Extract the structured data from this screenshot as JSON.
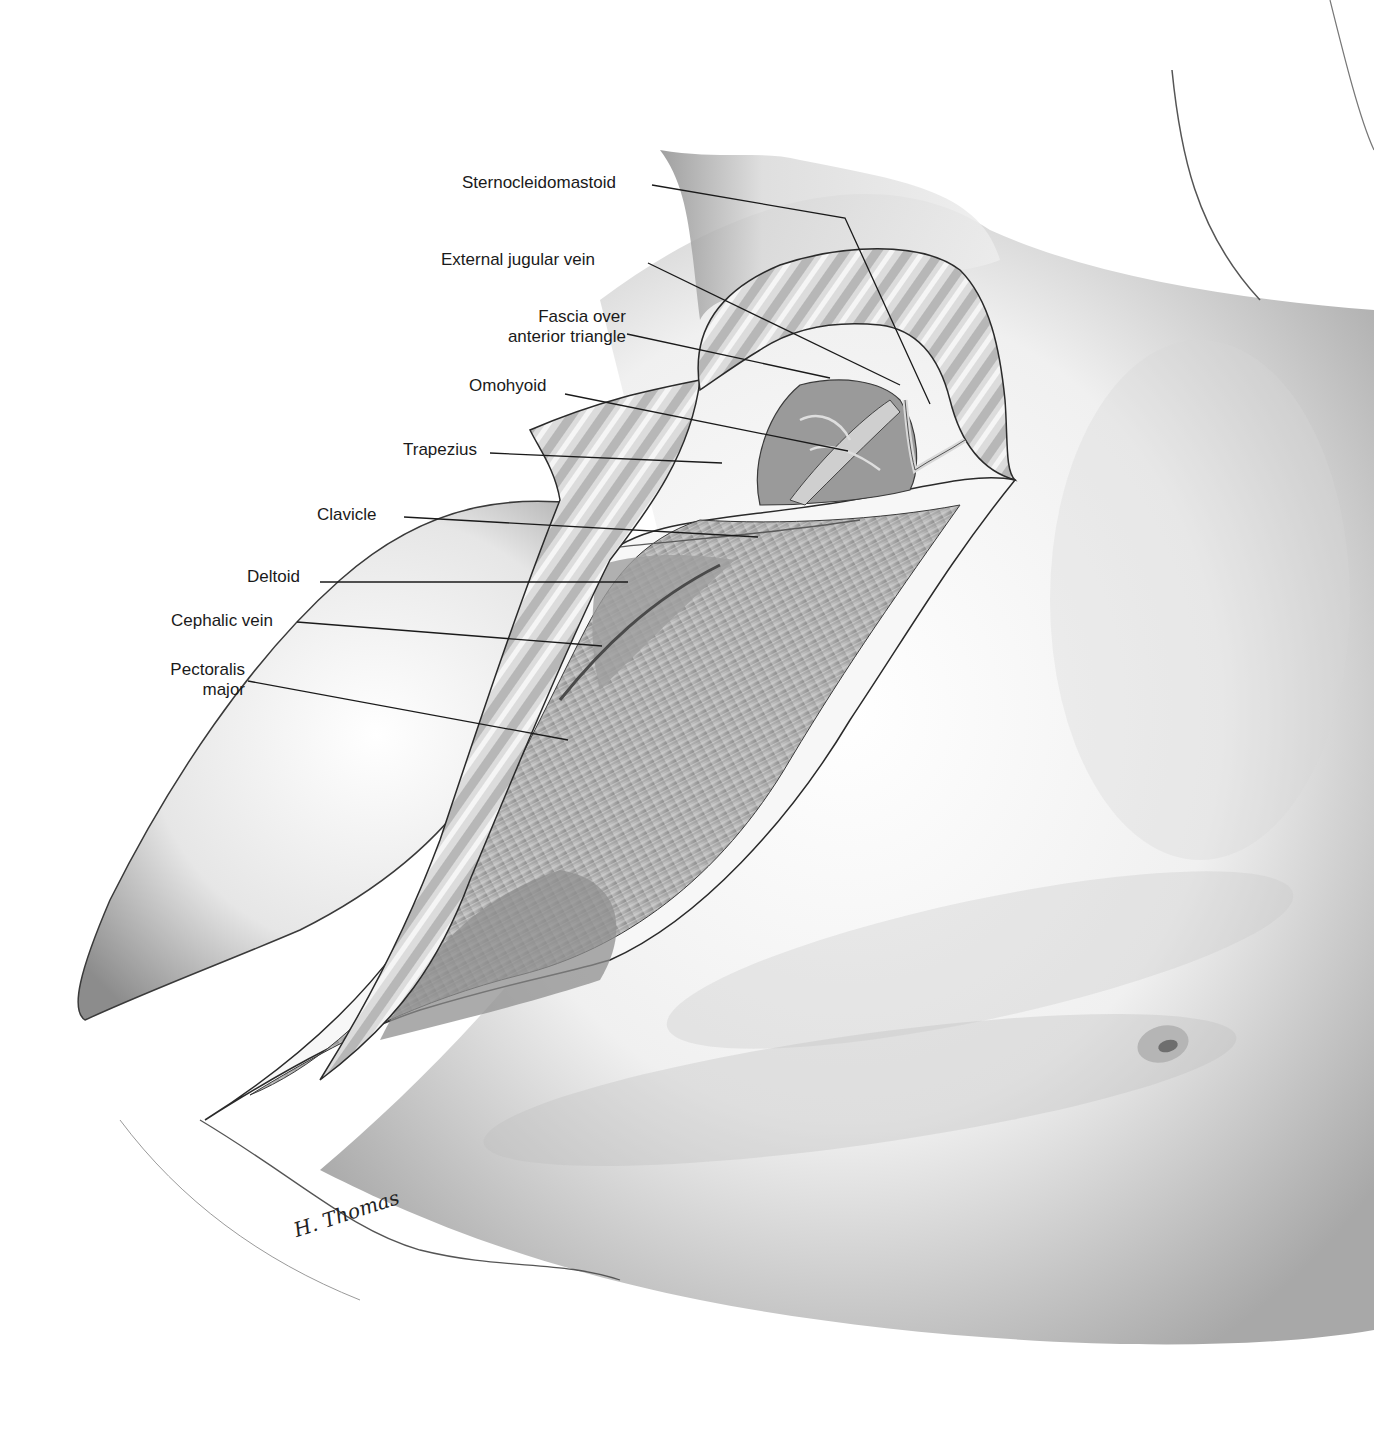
{
  "figure": {
    "type": "anatomical-illustration",
    "signature": "H. Thomas"
  },
  "labels": [
    {
      "id": "sternocleidomastoid",
      "text": "Sternocleidomastoid",
      "x": 462,
      "y": 173,
      "align": "left",
      "leader": [
        [
          652,
          185
        ],
        [
          845,
          218
        ],
        [
          930,
          404
        ]
      ]
    },
    {
      "id": "external-jugular-vein",
      "text": "External jugular vein",
      "x": 441,
      "y": 250,
      "align": "left",
      "leader": [
        [
          648,
          263
        ],
        [
          900,
          385
        ]
      ]
    },
    {
      "id": "fascia-over-anterior-triangle",
      "text": "Fascia over\nanterior triangle",
      "x": 480,
      "y": 307,
      "align": "right",
      "leader": [
        [
          627,
          334
        ],
        [
          830,
          378
        ]
      ]
    },
    {
      "id": "omohyoid",
      "text": "Omohyoid",
      "x": 469,
      "y": 376,
      "align": "left",
      "leader": [
        [
          565,
          394
        ],
        [
          848,
          451
        ]
      ]
    },
    {
      "id": "trapezius",
      "text": "Trapezius",
      "x": 403,
      "y": 440,
      "align": "left",
      "leader": [
        [
          490,
          453
        ],
        [
          722,
          463
        ]
      ]
    },
    {
      "id": "clavicle",
      "text": "Clavicle",
      "x": 317,
      "y": 505,
      "align": "left",
      "leader": [
        [
          404,
          517
        ],
        [
          758,
          537
        ]
      ]
    },
    {
      "id": "deltoid",
      "text": "Deltoid",
      "x": 247,
      "y": 567,
      "align": "left",
      "leader": [
        [
          320,
          582
        ],
        [
          628,
          582
        ]
      ]
    },
    {
      "id": "cephalic-vein",
      "text": "Cephalic vein",
      "x": 171,
      "y": 611,
      "align": "left",
      "leader": [
        [
          297,
          622
        ],
        [
          602,
          646
        ]
      ]
    },
    {
      "id": "pectoralis-major",
      "text": "Pectoralis\nmajor",
      "x": 155,
      "y": 660,
      "align": "right",
      "leader": [
        [
          248,
          681
        ],
        [
          568,
          740
        ]
      ]
    }
  ],
  "colors": {
    "background": "#ffffff",
    "skin_light": "#f2f2f2",
    "skin_mid": "#c8c8c8",
    "skin_dark": "#7a7a7a",
    "outline": "#2a2a2a",
    "muscle": "#b9b9b9",
    "label_text": "#1a1a1a",
    "leader_line": "#1a1a1a"
  }
}
